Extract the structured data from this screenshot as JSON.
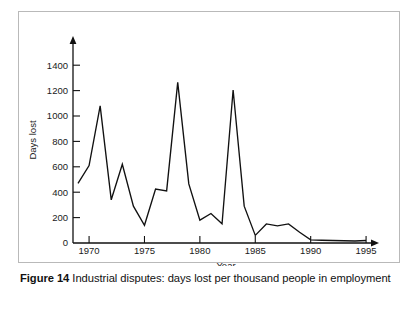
{
  "figure": {
    "caption_label": "Figure 14",
    "caption_text": "Industrial disputes: days lost per thousand people in employment"
  },
  "colors": {
    "line": "#111111",
    "axis": "#111111",
    "frame": "#b9b9b9",
    "background": "#ffffff",
    "text": "#1a1a1a"
  },
  "chart_data": {
    "type": "line",
    "title": "",
    "xlabel": "Year",
    "ylabel": "Days lost",
    "xlim": [
      1969,
      1996
    ],
    "ylim": [
      0,
      1500
    ],
    "xticks": [
      1970,
      1975,
      1980,
      1985,
      1990,
      1995
    ],
    "yticks": [
      0,
      200,
      400,
      600,
      800,
      1000,
      1200,
      1400
    ],
    "xticklabels": [
      "1970",
      "1975",
      "1980",
      "1985",
      "1990",
      "1995"
    ],
    "yticklabels": [
      "0",
      "200",
      "400",
      "600",
      "800",
      "1000",
      "1200",
      "1400"
    ],
    "grid": false,
    "legend": false,
    "series": [
      {
        "name": "Days lost per thousand people in employment",
        "x": [
          1969,
          1970,
          1971,
          1972,
          1973,
          1974,
          1975,
          1976,
          1977,
          1978,
          1979,
          1980,
          1981,
          1982,
          1983,
          1984,
          1985,
          1986,
          1987,
          1988,
          1989,
          1990,
          1991,
          1992,
          1993,
          1994,
          1995
        ],
        "values": [
          470,
          610,
          1080,
          340,
          620,
          290,
          140,
          425,
          410,
          1265,
          465,
          180,
          232,
          152,
          1205,
          290,
          60,
          150,
          135,
          150,
          85,
          25,
          22,
          20,
          18,
          16,
          20
        ]
      }
    ]
  }
}
